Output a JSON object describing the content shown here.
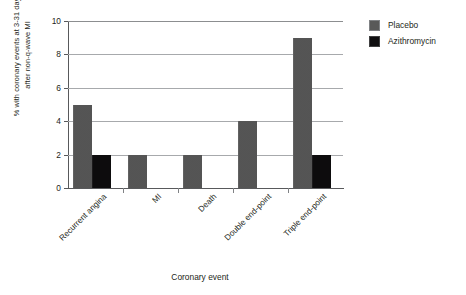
{
  "chart_data": {
    "type": "bar",
    "title": "",
    "xlabel": "Coronary event",
    "ylabel_line1": "% with coronary events at 3-31 days",
    "ylabel_line2": "after non-q-wave MI",
    "categories": [
      "Recurrent angina",
      "MI",
      "Death",
      "Double end-point",
      "Triple end-point"
    ],
    "series": [
      {
        "name": "Placebo",
        "color": "#595959",
        "values": [
          5,
          2,
          2,
          4,
          9
        ]
      },
      {
        "name": "Azithromycin",
        "color": "#100f10",
        "values": [
          2,
          0,
          0,
          0,
          2
        ]
      }
    ],
    "ylim": [
      0,
      10
    ],
    "yticks": [
      0,
      2,
      4,
      6,
      8,
      10
    ],
    "ytick_labels": [
      "0",
      "2",
      "4",
      "6",
      "8",
      "10"
    ],
    "grid": true,
    "legend_position": "right-top"
  }
}
